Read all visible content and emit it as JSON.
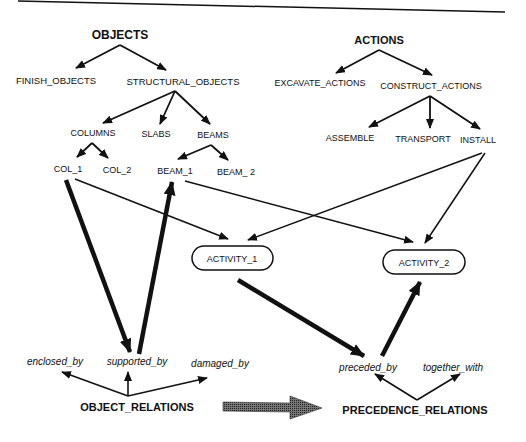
{
  "diagram": {
    "objects_tree": {
      "root": "OBJECTS",
      "children": [
        "FINISH_OBJECTS",
        "STRUCTURAL_OBJECTS"
      ],
      "structural_children": [
        "COLUMNS",
        "SLABS",
        "BEAMS"
      ],
      "columns_children": [
        "COL_1",
        "COL_2"
      ],
      "beams_children": [
        "BEAM_1",
        "BEAM_ 2"
      ]
    },
    "actions_tree": {
      "root": "ACTIONS",
      "children": [
        "EXCAVATE_ACTIONS",
        "CONSTRUCT_ACTIONS"
      ],
      "construct_children": [
        "ASSEMBLE",
        "TRANSPORT",
        "INSTALL"
      ]
    },
    "activities": [
      "ACTIVITY_1",
      "ACTIVITY_2"
    ],
    "object_relations": {
      "root": "OBJECT_RELATIONS",
      "children": [
        "enclosed_by",
        "supported_by",
        "damaged_by"
      ]
    },
    "precedence_relations": {
      "root": "PRECEDENCE_RELATIONS",
      "children": [
        "preceded_by",
        "together_with"
      ]
    },
    "edges": [
      {
        "from": "COL_1",
        "to": "ACTIVITY_1",
        "style": "thin"
      },
      {
        "from": "BEAM_1",
        "to": "ACTIVITY_2",
        "style": "thin"
      },
      {
        "from": "INSTALL",
        "to": "ACTIVITY_1",
        "style": "thin"
      },
      {
        "from": "INSTALL",
        "to": "ACTIVITY_2",
        "style": "thin"
      },
      {
        "from": "COL_1",
        "to": "supported_by",
        "style": "bold"
      },
      {
        "from": "supported_by",
        "to": "BEAM_1",
        "style": "bold"
      },
      {
        "from": "ACTIVITY_1",
        "to": "preceded_by",
        "style": "bold"
      },
      {
        "from": "preceded_by",
        "to": "ACTIVITY_2",
        "style": "bold"
      },
      {
        "from": "OBJECT_RELATIONS",
        "to": "PRECEDENCE_RELATIONS",
        "style": "wide-gray"
      }
    ],
    "colors": {
      "ink": "#111111",
      "big_arrow": "#555555",
      "background": "#ffffff"
    }
  }
}
